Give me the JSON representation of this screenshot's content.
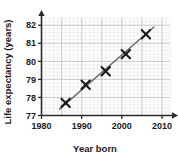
{
  "chart_data": {
    "type": "scatter",
    "title": "",
    "xlabel": "Year born",
    "ylabel": "Life expectancy (years)",
    "xlim": [
      1980,
      2012
    ],
    "ylim": [
      77,
      82.4
    ],
    "xticks": [
      1980,
      1990,
      2000,
      2010
    ],
    "yticks": [
      77,
      78,
      79,
      80,
      81,
      82
    ],
    "grid": true,
    "grid_minor": true,
    "legend": null,
    "marker": "x-cross",
    "points": [
      {
        "x": 1986,
        "y": 77.7
      },
      {
        "x": 1991,
        "y": 78.7
      },
      {
        "x": 1996,
        "y": 79.45
      },
      {
        "x": 2001,
        "y": 80.4
      },
      {
        "x": 2006,
        "y": 81.5
      }
    ],
    "trendline": {
      "label": "line of best fit",
      "x_start": 1984.5,
      "y_start": 77.35,
      "x_end": 2008.0,
      "y_end": 81.9
    },
    "colors": {
      "axis": "#2a2a2a",
      "grid_major": "#b8bcc4",
      "grid_minor": "#dfe2e7",
      "marker": "#1a1a1a",
      "trendline": "#6e6e6e",
      "text": "#1a1a1a",
      "background": "#ffffff"
    },
    "xtick_labels": [
      "1980",
      "1990",
      "2000",
      "2010"
    ],
    "ytick_labels": [
      "77",
      "78",
      "79",
      "80",
      "81",
      "82"
    ]
  }
}
